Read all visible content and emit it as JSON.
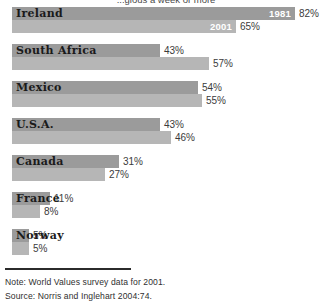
{
  "title": "...gious a week or more",
  "footer": {
    "note": "Note: World Values survey data for 2001.",
    "source": "Source: Norris and Inglehart 2004:74."
  },
  "series_labels": {
    "older": "1981",
    "newer": "2001"
  },
  "colors": {
    "series_1981": "#9b9b9b",
    "series_2001": "#b6b6b6",
    "background": "#ffffff",
    "text": "#1a1a1a"
  },
  "chart_data": {
    "type": "bar",
    "orientation": "horizontal",
    "title": "...gious a week or more",
    "xlabel": "",
    "ylabel": "",
    "xlim": [
      0,
      100
    ],
    "grid": false,
    "legend": "inline-on-first-group",
    "categories": [
      "Ireland",
      "South Africa",
      "Mexico",
      "U.S.A.",
      "Canada",
      "France",
      "Norway"
    ],
    "series": [
      {
        "name": "1981",
        "color": "#9b9b9b",
        "values": [
          82,
          43,
          54,
          43,
          31,
          11,
          5
        ]
      },
      {
        "name": "2001",
        "color": "#b6b6b6",
        "values": [
          65,
          57,
          55,
          46,
          27,
          8,
          5
        ]
      }
    ],
    "value_labels": [
      {
        "category": "Ireland",
        "1981": "82%",
        "2001": "65%"
      },
      {
        "category": "South Africa",
        "1981": "43%",
        "2001": "57%"
      },
      {
        "category": "Mexico",
        "1981": "54%",
        "2001": "55%"
      },
      {
        "category": "U.S.A.",
        "1981": "43%",
        "2001": "46%"
      },
      {
        "category": "Canada",
        "1981": "31%",
        "2001": "27%"
      },
      {
        "category": "France",
        "1981": "11%",
        "2001": "8%"
      },
      {
        "category": "Norway",
        "1981": "5%",
        "2001": "5%"
      }
    ],
    "notes": [
      "Note: World Values survey data for 2001.",
      "Source: Norris and Inglehart 2004:74."
    ]
  }
}
